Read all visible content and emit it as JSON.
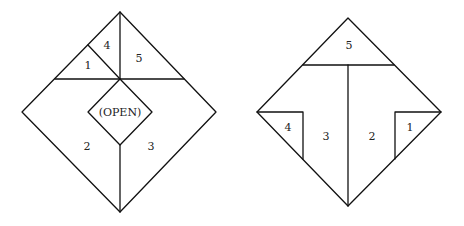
{
  "left_figure": {
    "labels": {
      "p1": "1",
      "p2": "2",
      "p3": "3",
      "p4": "4",
      "p5": "5",
      "center": "(OPEN)"
    }
  },
  "right_figure": {
    "labels": {
      "p1": "1",
      "p2": "2",
      "p3": "3",
      "p4": "4",
      "p5": "5"
    }
  }
}
